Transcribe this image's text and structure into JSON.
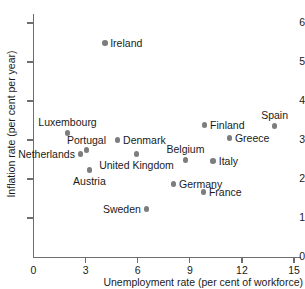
{
  "chart_data": {
    "type": "scatter",
    "title": "",
    "xlabel": "Unemployment rate (per cent of workforce)",
    "ylabel": "Inflation rate (per cent per year)",
    "xlim": [
      0,
      15.5
    ],
    "ylim": [
      0,
      6.4
    ],
    "xticks": [
      0,
      3,
      6,
      9,
      12,
      15
    ],
    "yticks": [
      0,
      1,
      2,
      3,
      4,
      5,
      6
    ],
    "xtick_labels": [
      "0",
      "3",
      "6",
      "9",
      "12",
      "15"
    ],
    "ytick_labels": [
      "0",
      "1",
      "2",
      "3",
      "4",
      "5",
      "6"
    ],
    "grid": false,
    "legend": "none",
    "marker_color": "#7d7d7d",
    "axis_color": "#6e6e6e",
    "text_color": "#1a1a1a",
    "background": "#ffffff",
    "points": [
      {
        "label": "Ireland",
        "x": 4.1,
        "y": 5.49,
        "label_pos": "right"
      },
      {
        "label": "Spain",
        "x": 13.88,
        "y": 3.36,
        "label_pos": "above"
      },
      {
        "label": "Finland",
        "x": 9.85,
        "y": 3.38,
        "label_pos": "right"
      },
      {
        "label": "Luxembourg",
        "x": 1.96,
        "y": 3.18,
        "label_pos": "above"
      },
      {
        "label": "Greece",
        "x": 11.28,
        "y": 3.05,
        "label_pos": "right"
      },
      {
        "label": "Denmark",
        "x": 4.84,
        "y": 3.0,
        "label_pos": "right"
      },
      {
        "label": "Portugal",
        "x": 3.05,
        "y": 2.74,
        "label_pos": "above"
      },
      {
        "label": "Netherlands",
        "x": 2.7,
        "y": 2.64,
        "label_pos": "left"
      },
      {
        "label": "United Kingdom",
        "x": 5.93,
        "y": 2.64,
        "label_pos": "below"
      },
      {
        "label": "Belgium",
        "x": 8.75,
        "y": 2.49,
        "label_pos": "above"
      },
      {
        "label": "Italy",
        "x": 10.35,
        "y": 2.46,
        "label_pos": "right"
      },
      {
        "label": "Austria",
        "x": 3.22,
        "y": 2.23,
        "label_pos": "below"
      },
      {
        "label": "Germany",
        "x": 8.06,
        "y": 1.87,
        "label_pos": "right"
      },
      {
        "label": "France",
        "x": 9.78,
        "y": 1.66,
        "label_pos": "right"
      },
      {
        "label": "Sweden",
        "x": 6.5,
        "y": 1.23,
        "label_pos": "left"
      }
    ]
  }
}
